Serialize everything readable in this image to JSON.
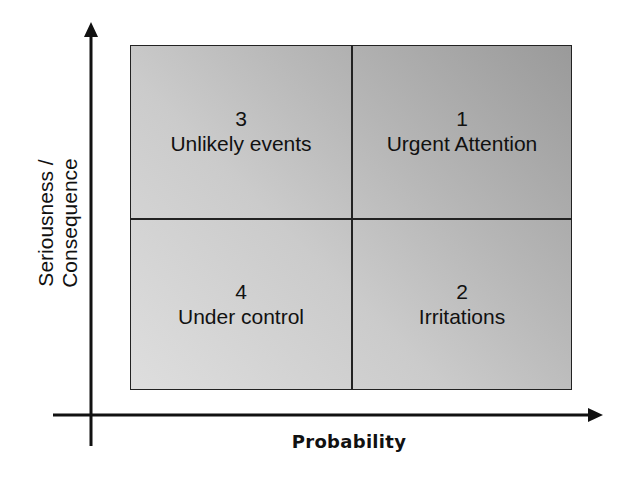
{
  "diagram": {
    "title": "",
    "y_axis_label": {
      "line1": "Seriousness /",
      "line2": "Consequence"
    },
    "x_axis_label": "Probability",
    "quadrants": {
      "top_left": {
        "number": "3",
        "label": "Unlikely events"
      },
      "top_right": {
        "number": "1",
        "label": "Urgent Attention"
      },
      "bottom_left": {
        "number": "4",
        "label": "Under control"
      },
      "bottom_right": {
        "number": "2",
        "label": "Irritations"
      }
    },
    "colors": {
      "fill_dark": "#9a9a9a",
      "fill_light": "#dedede",
      "lines": "#222222",
      "text": "#111111",
      "background": "#ffffff"
    }
  }
}
